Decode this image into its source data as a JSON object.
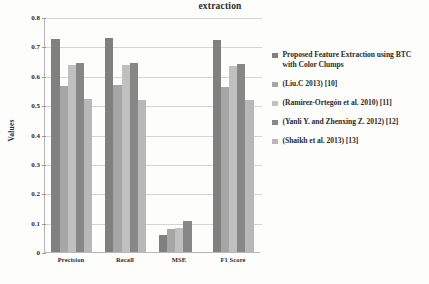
{
  "chart_data": {
    "type": "bar",
    "title": "extraction",
    "xlabel": "",
    "ylabel": "Values",
    "ylim": [
      0,
      0.8
    ],
    "ytick_labels": [
      "0",
      "0.1",
      "0.2",
      "0.3",
      "0.4",
      "0.5",
      "0.6",
      "0.7",
      "0.8"
    ],
    "ytick_values": [
      0,
      0.1,
      0.2,
      0.3,
      0.4,
      0.5,
      0.6,
      0.7,
      0.8
    ],
    "grid": true,
    "legend_position": "right",
    "categories": [
      "Precision",
      "Recall",
      "MSE",
      "F1 Score"
    ],
    "series": [
      {
        "name": "Proposed Feature Extraction using BTC with Color Clumps",
        "color": "#808080",
        "values": [
          0.725,
          0.728,
          0.058,
          0.722
        ]
      },
      {
        "name": "(Liu.C 2013) [10]",
        "color": "#a6a6a6",
        "values": [
          0.565,
          0.567,
          0.078,
          0.563
        ]
      },
      {
        "name": "(Ramirez-Ortegón et al. 2010) [11]",
        "color": "#c0c0c0",
        "values": [
          0.635,
          0.637,
          0.082,
          0.632
        ]
      },
      {
        "name": "(Yanli Y. and Zhenxing Z. 2012) [12]",
        "color": "#878787",
        "values": [
          0.645,
          0.643,
          0.105,
          0.641
        ]
      },
      {
        "name": "(Shaikh et al. 2013) [13]",
        "color": "#b8b8b8",
        "values": [
          0.521,
          0.519,
          0.0,
          0.518
        ]
      }
    ]
  }
}
